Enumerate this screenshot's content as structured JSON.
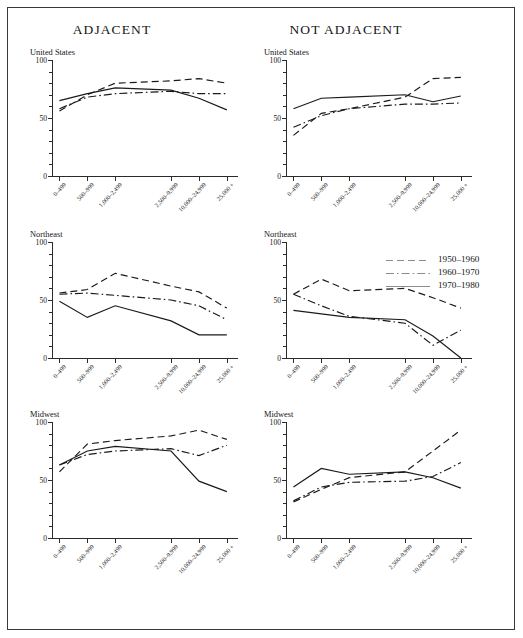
{
  "figure": {
    "column_titles": [
      "ADJACENT",
      "NOT ADJACENT"
    ],
    "row_labels": [
      "United States",
      "Northeast",
      "Midwest"
    ]
  },
  "legend": {
    "position": "top-right of Northeast / NOT ADJACENT panel",
    "entries": [
      {
        "label": "1950–1960",
        "style": "dashed"
      },
      {
        "label": "1960–1970",
        "style": "dash-dot"
      },
      {
        "label": "1970–1980",
        "style": "solid"
      }
    ]
  },
  "axes": {
    "y_ticks_major": [
      "0",
      "50",
      "100"
    ],
    "y_minor_step": 10,
    "ylim": [
      0,
      100
    ],
    "x_categories": [
      "0–499",
      "500–999",
      "1,000–2,499",
      "2,500–9,999",
      "10,000–24,999",
      "25,000 +"
    ],
    "x_positions_pct": [
      4,
      19,
      34,
      64,
      79,
      94
    ]
  },
  "chart_data": [
    {
      "type": "line",
      "title": "United States",
      "panel": "ADJACENT",
      "xlabel": "",
      "ylabel": "",
      "ylim": [
        0,
        100
      ],
      "grid": false,
      "categories": [
        "0–499",
        "500–999",
        "1,000–2,499",
        "2,500–9,999",
        "10,000–24,999",
        "25,000 +"
      ],
      "series": [
        {
          "name": "1950–1960",
          "style": "dashed",
          "values": [
            56,
            70,
            80,
            82,
            84,
            80
          ]
        },
        {
          "name": "1960–1970",
          "style": "dash-dot",
          "values": [
            58,
            68,
            71,
            73,
            71,
            71
          ]
        },
        {
          "name": "1970–1980",
          "style": "solid",
          "values": [
            65,
            71,
            76,
            74,
            67,
            57
          ]
        }
      ]
    },
    {
      "type": "line",
      "title": "United States",
      "panel": "NOT ADJACENT",
      "xlabel": "",
      "ylabel": "",
      "ylim": [
        0,
        100
      ],
      "grid": false,
      "categories": [
        "0–499",
        "500–999",
        "1,000–2,499",
        "2,500–9,999",
        "10,000–24,999",
        "25,000 +"
      ],
      "series": [
        {
          "name": "1950–1960",
          "style": "dashed",
          "values": [
            35,
            54,
            58,
            68,
            84,
            85
          ]
        },
        {
          "name": "1960–1970",
          "style": "dash-dot",
          "values": [
            42,
            52,
            58,
            62,
            62,
            63
          ]
        },
        {
          "name": "1970–1980",
          "style": "solid",
          "values": [
            58,
            67,
            68,
            70,
            64,
            69
          ]
        }
      ]
    },
    {
      "type": "line",
      "title": "Northeast",
      "panel": "ADJACENT",
      "xlabel": "",
      "ylabel": "",
      "ylim": [
        0,
        100
      ],
      "grid": false,
      "categories": [
        "0–499",
        "500–999",
        "1,000–2,499",
        "2,500–9,999",
        "10,000–24,999",
        "25,000 +"
      ],
      "series": [
        {
          "name": "1950–1960",
          "style": "dashed",
          "values": [
            56,
            59,
            73,
            62,
            57,
            43
          ]
        },
        {
          "name": "1960–1970",
          "style": "dash-dot",
          "values": [
            55,
            56,
            54,
            50,
            45,
            33
          ]
        },
        {
          "name": "1970–1980",
          "style": "solid",
          "values": [
            49,
            35,
            45,
            32,
            20,
            20
          ]
        }
      ]
    },
    {
      "type": "line",
      "title": "Northeast",
      "panel": "NOT ADJACENT",
      "xlabel": "",
      "ylabel": "",
      "ylim": [
        0,
        100
      ],
      "grid": false,
      "categories": [
        "0–499",
        "500–999",
        "1,000–2,499",
        "2,500–9,999",
        "10,000–24,999",
        "25,000 +"
      ],
      "series": [
        {
          "name": "1950–1960",
          "style": "dashed",
          "values": [
            55,
            68,
            58,
            60,
            52,
            43
          ]
        },
        {
          "name": "1960–1970",
          "style": "dash-dot",
          "values": [
            55,
            45,
            36,
            30,
            11,
            24
          ]
        },
        {
          "name": "1970–1980",
          "style": "solid",
          "values": [
            41,
            38,
            35,
            33,
            19,
            0
          ]
        }
      ]
    },
    {
      "type": "line",
      "title": "Midwest",
      "panel": "ADJACENT",
      "xlabel": "",
      "ylabel": "",
      "ylim": [
        0,
        100
      ],
      "grid": false,
      "categories": [
        "0–499",
        "500–999",
        "1,000–2,499",
        "2,500–9,999",
        "10,000–24,999",
        "25,000 +"
      ],
      "series": [
        {
          "name": "1950–1960",
          "style": "dashed",
          "values": [
            57,
            81,
            84,
            88,
            93,
            85
          ]
        },
        {
          "name": "1960–1970",
          "style": "dash-dot",
          "values": [
            63,
            72,
            75,
            77,
            71,
            80
          ]
        },
        {
          "name": "1970–1980",
          "style": "solid",
          "values": [
            63,
            75,
            79,
            75,
            49,
            40
          ]
        }
      ]
    },
    {
      "type": "line",
      "title": "Midwest",
      "panel": "NOT ADJACENT",
      "xlabel": "",
      "ylabel": "",
      "ylim": [
        0,
        100
      ],
      "grid": false,
      "categories": [
        "0–499",
        "500–999",
        "1,000–2,499",
        "2,500–9,999",
        "10,000–24,999",
        "25,000 +"
      ],
      "series": [
        {
          "name": "1950–1960",
          "style": "dashed",
          "values": [
            31,
            42,
            52,
            57,
            75,
            93
          ]
        },
        {
          "name": "1960–1970",
          "style": "dash-dot",
          "values": [
            32,
            44,
            48,
            49,
            53,
            65
          ]
        },
        {
          "name": "1970–1980",
          "style": "solid",
          "values": [
            44,
            60,
            55,
            57,
            52,
            43
          ]
        }
      ]
    }
  ]
}
